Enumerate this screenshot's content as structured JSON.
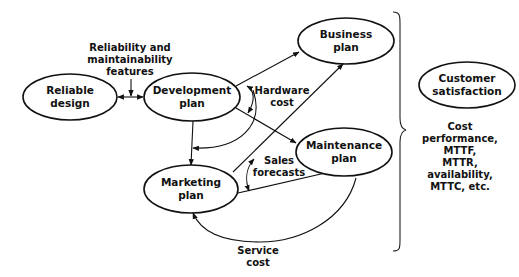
{
  "nodes": {
    "reliable_design": {
      "line1": "Reliable",
      "line2": "design"
    },
    "development_plan": {
      "line1": "Development",
      "line2": "plan"
    },
    "business_plan": {
      "line1": "Business",
      "line2": "plan"
    },
    "maintenance_plan": {
      "line1": "Maintenance",
      "line2": "plan"
    },
    "marketing_plan": {
      "line1": "Marketing",
      "line2": "plan"
    },
    "customer_satisfaction": {
      "line1": "Customer",
      "line2": "satisfaction"
    }
  },
  "edge_labels": {
    "reliability_features": [
      "Reliability and",
      "maintainability",
      "features"
    ],
    "hardware_cost": [
      "Hardware",
      "cost"
    ],
    "sales_forecasts": [
      "Sales",
      "forecasts"
    ],
    "service_cost": [
      "Service",
      "cost"
    ]
  },
  "side_metrics": [
    "Cost",
    "performance,",
    "MTTF,",
    "MTTR,",
    "availability,",
    "MTTC, etc."
  ],
  "colors": {
    "stroke": "#111111",
    "background": "#ffffff"
  }
}
